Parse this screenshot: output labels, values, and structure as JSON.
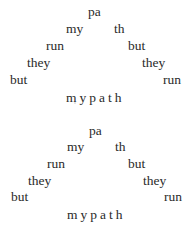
{
  "poems": [
    {
      "lines": [
        {
          "left": "pa",
          "right": ""
        },
        {
          "left": "my",
          "right": "th"
        },
        {
          "left": "run",
          "right": "but"
        },
        {
          "left": "they",
          "right": "they"
        },
        {
          "left": "but",
          "right": "run"
        }
      ],
      "footer": "mypath"
    },
    {
      "lines": [
        {
          "left": "pa",
          "right": ""
        },
        {
          "left": "my",
          "right": "th"
        },
        {
          "left": "run",
          "right": "but"
        },
        {
          "left": "they",
          "right": "they"
        },
        {
          "left": "but",
          "right": "run"
        }
      ],
      "footer": "mypath"
    }
  ]
}
